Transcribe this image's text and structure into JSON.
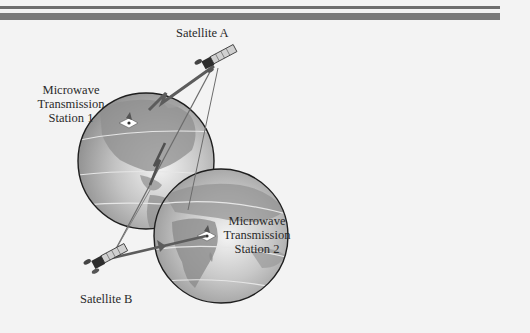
{
  "labels": {
    "satellite_a": "Satellite A",
    "satellite_b": "Satellite B",
    "station_1": [
      "Microwave",
      "Transmission",
      "Station 1"
    ],
    "station_2": [
      "Microwave",
      "Transmission",
      "Station 2"
    ]
  },
  "colors": {
    "background": "#f3f3f3",
    "header_bar": "#747474",
    "globe_ocean": "#b9b9b9",
    "globe_land": "#8c8c8c",
    "outline": "#1e1e1e",
    "beam": "#6a6a6a"
  }
}
